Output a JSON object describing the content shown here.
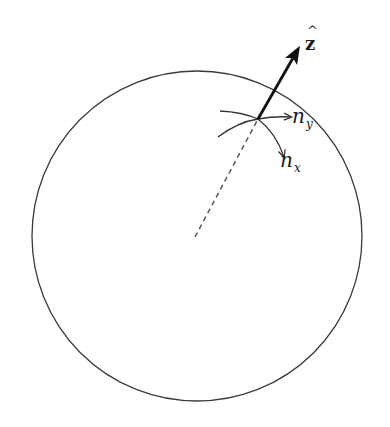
{
  "figure": {
    "colors": {
      "background": "#ffffff",
      "stroke": "#333333",
      "arrow": "#111111",
      "dashed": "#555555"
    },
    "sphere": {
      "center": [
        197,
        236
      ],
      "radius": 165
    },
    "surface_point": [
      258,
      119
    ],
    "normal_vector": {
      "from": [
        258,
        119
      ],
      "to": [
        302,
        42
      ],
      "label_main": "z",
      "label_hat": "^"
    },
    "radius_line": {
      "from": [
        195,
        237
      ],
      "to": [
        258,
        119
      ],
      "style": "dashed"
    },
    "tangent_y": {
      "label_main": "n",
      "label_sub": "y"
    },
    "tangent_x": {
      "label_main": "n",
      "label_sub": "x"
    }
  }
}
